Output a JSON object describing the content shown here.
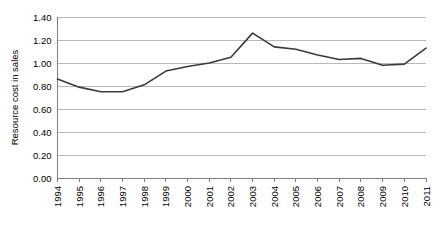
{
  "chart_data": {
    "type": "line",
    "title": "",
    "subtitle": "",
    "xlabel": "",
    "ylabel": "Resource cost in sales",
    "categories": [
      "1994",
      "1995",
      "1996",
      "1997",
      "1998",
      "1999",
      "2000",
      "2001",
      "2002",
      "2003",
      "2004",
      "2005",
      "2006",
      "2007",
      "2008",
      "2009",
      "2010",
      "2011"
    ],
    "x": [
      1994,
      1995,
      1996,
      1997,
      1998,
      1999,
      2000,
      2001,
      2002,
      2003,
      2004,
      2005,
      2006,
      2007,
      2008,
      2009,
      2010,
      2011
    ],
    "series": [
      {
        "name": "Resource cost in sales",
        "values": [
          0.86,
          0.79,
          0.75,
          0.75,
          0.81,
          0.93,
          0.97,
          1.0,
          1.05,
          1.26,
          1.14,
          1.12,
          1.07,
          1.03,
          1.04,
          0.98,
          0.99,
          1.13
        ],
        "color": "#3a3a3a"
      }
    ],
    "ylim": [
      0.0,
      1.4
    ],
    "ytick_values": [
      0.0,
      0.2,
      0.4,
      0.6,
      0.8,
      1.0,
      1.2,
      1.4
    ],
    "ytick_labels": [
      "0.00",
      "0.20",
      "0.40",
      "0.60",
      "0.80",
      "1.00",
      "1.20",
      "1.40"
    ],
    "xtick_labels": [
      "1994",
      "1995",
      "1996",
      "1997",
      "1998",
      "1999",
      "2000",
      "2001",
      "2002",
      "2003",
      "2004",
      "2005",
      "2006",
      "2007",
      "2008",
      "2009",
      "2010",
      "2011"
    ],
    "grid": true,
    "grid_axis": "y",
    "grid_color": "#b9b9b9",
    "axis_color": "#808080",
    "legend": false,
    "legend_position": "none",
    "background": "#ffffff",
    "annotations": []
  }
}
